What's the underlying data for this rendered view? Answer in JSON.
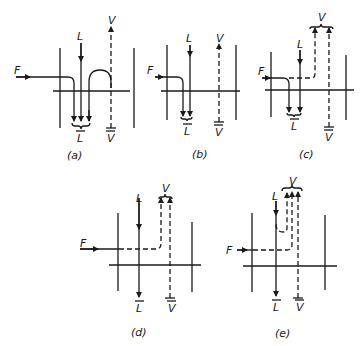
{
  "figure": {
    "panels": [
      {
        "id": "a",
        "caption": "(a)",
        "labels": {
          "feed": "F",
          "liquid_in": "L",
          "liquid_out": "L",
          "vapor_in": "V",
          "vapor_out": "V"
        }
      },
      {
        "id": "b",
        "caption": "(b)",
        "labels": {
          "feed": "F",
          "liquid_in": "L",
          "liquid_out": "L",
          "vapor_in": "V",
          "vapor_out": "V"
        }
      },
      {
        "id": "c",
        "caption": "(c)",
        "labels": {
          "feed": "F",
          "liquid_in": "L",
          "liquid_out": "L",
          "vapor_in": "V",
          "vapor_out": "V"
        }
      },
      {
        "id": "d",
        "caption": "(d)",
        "labels": {
          "feed": "F",
          "liquid_in": "L",
          "liquid_out": "L",
          "vapor_in": "V",
          "vapor_out": "V"
        }
      },
      {
        "id": "e",
        "caption": "(e)",
        "labels": {
          "feed": "F",
          "liquid_in": "L",
          "liquid_out": "L",
          "vapor_in": "V",
          "vapor_out": "V"
        }
      }
    ]
  }
}
